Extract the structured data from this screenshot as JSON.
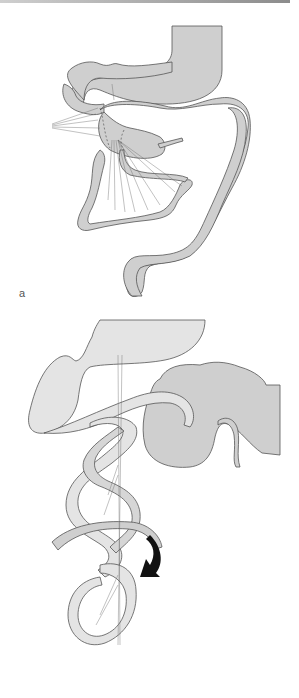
{
  "figure": {
    "panels": [
      {
        "id": "a",
        "label": "a",
        "description": "Normal intestinal rotation with stomach, duodenum, small bowel loop with mesenteric vessels, and colon"
      },
      {
        "id": "b",
        "label": "b",
        "description": "Midgut volvulus: small bowel twisted around mesenteric axis, curved arrow indicating rotation direction"
      }
    ],
    "colors": {
      "organ_fill_dark": "#cfcfcf",
      "organ_fill_light": "#e4e4e4",
      "outline": "#555555",
      "arrow": "#111111",
      "background": "#ffffff"
    }
  }
}
